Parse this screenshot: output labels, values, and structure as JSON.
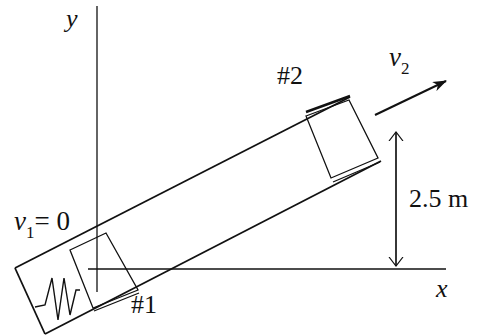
{
  "diagram": {
    "type": "physics-free-body-incline",
    "axes": {
      "x_label": "x",
      "y_label": "y"
    },
    "labels": {
      "v1_symbol": "v",
      "v1_sub": "1",
      "v1_eq": "= 0",
      "v2_symbol": "v",
      "v2_sub": "2",
      "block1": "#1",
      "block2": "#2",
      "height": "2.5 m"
    },
    "elements": [
      "y-axis",
      "x-axis",
      "inclined-tube",
      "spring",
      "block-1",
      "block-2",
      "velocity-arrow-v2",
      "height-dimension-arrow"
    ],
    "colors": {
      "stroke": "#111111",
      "background": "#ffffff"
    }
  }
}
